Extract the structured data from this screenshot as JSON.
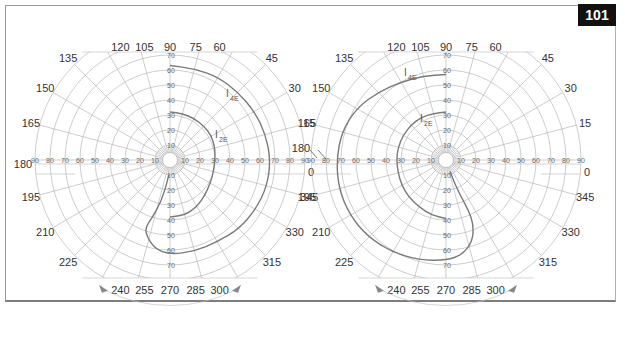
{
  "page": {
    "figure_number": "101",
    "frame_color": "#9a9a9a",
    "badge_bg": "#111111",
    "badge_fg": "#ffffff"
  },
  "chart_data": [
    {
      "type": "polar-visual-field",
      "title": "",
      "eye": "left-chart",
      "center": [
        170,
        160
      ],
      "px_per_degree": 1.5,
      "max_degree": 90,
      "clip_top_y": 52,
      "clip_bottom_y": 278,
      "meridian_labels": [
        "0",
        "15",
        "30",
        "45",
        "60",
        "75",
        "90",
        "105",
        "120",
        "135",
        "150",
        "165",
        "180",
        "195",
        "210",
        "225",
        "240",
        "255",
        "270",
        "285",
        "300",
        "315",
        "330",
        "345"
      ],
      "ring_labels_horizontal": [
        "10",
        "20",
        "30",
        "40",
        "50",
        "60",
        "70",
        "80",
        "90"
      ],
      "ring_labels_vertical": [
        "10",
        "20",
        "30",
        "40",
        "50",
        "60",
        "70"
      ],
      "isopters": [
        {
          "name": "I4E",
          "label": "I",
          "sub": "4E",
          "label_pos": [
            226,
            97
          ],
          "points": [
            [
              90,
              63
            ],
            [
              75,
              63
            ],
            [
              60,
              64
            ],
            [
              45,
              64
            ],
            [
              30,
              65
            ],
            [
              15,
              66
            ],
            [
              0,
              67
            ],
            [
              345,
              67
            ],
            [
              330,
              66
            ],
            [
              315,
              65
            ],
            [
              300,
              63
            ],
            [
              285,
              63
            ],
            [
              270,
              63
            ],
            [
              260,
              60
            ],
            [
              252,
              52
            ],
            [
              250,
              47
            ],
            [
              253,
              40
            ],
            [
              258,
              28
            ],
            [
              262,
              16
            ],
            [
              265,
              10
            ]
          ]
        },
        {
          "name": "I2E",
          "label": "I",
          "sub": "2E",
          "label_pos": [
            215,
            138
          ],
          "points": [
            [
              90,
              32
            ],
            [
              75,
              32
            ],
            [
              60,
              32
            ],
            [
              45,
              32
            ],
            [
              30,
              32
            ],
            [
              15,
              31
            ],
            [
              0,
              30
            ],
            [
              345,
              30
            ],
            [
              330,
              31
            ],
            [
              315,
              33
            ],
            [
              300,
              36
            ],
            [
              285,
              38
            ],
            [
              270,
              38
            ]
          ]
        }
      ],
      "bottom_arc": {
        "from_deg": 240,
        "to_deg": 300,
        "arrows": true
      }
    },
    {
      "type": "polar-visual-field",
      "title": "",
      "eye": "right-chart",
      "center": [
        446,
        160
      ],
      "px_per_degree": 1.5,
      "max_degree": 90,
      "clip_top_y": 52,
      "clip_bottom_y": 278,
      "meridian_labels": [
        "0",
        "15",
        "30",
        "45",
        "60",
        "75",
        "90",
        "105",
        "120",
        "135",
        "150",
        "165",
        "180",
        "195",
        "210",
        "225",
        "240",
        "255",
        "270",
        "285",
        "300",
        "315",
        "330",
        "345"
      ],
      "ring_labels_horizontal": [
        "10",
        "20",
        "30",
        "40",
        "50",
        "60",
        "70",
        "80",
        "90"
      ],
      "ring_labels_vertical": [
        "10",
        "20",
        "30",
        "40",
        "50",
        "60",
        "70"
      ],
      "isopters": [
        {
          "name": "I4E",
          "label": "I",
          "sub": "4E",
          "label_pos": [
            404,
            76
          ],
          "points": [
            [
              90,
              57
            ],
            [
              105,
              58
            ],
            [
              120,
              60
            ],
            [
              135,
              64
            ],
            [
              150,
              69
            ],
            [
              165,
              72
            ],
            [
              180,
              73
            ],
            [
              195,
              74
            ],
            [
              210,
              74
            ],
            [
              225,
              73
            ],
            [
              240,
              71
            ],
            [
              255,
              69
            ],
            [
              270,
              67
            ],
            [
              280,
              64
            ],
            [
              288,
              57
            ],
            [
              293,
              47
            ],
            [
              294,
              37
            ],
            [
              292,
              25
            ],
            [
              290,
              15
            ],
            [
              290,
              8
            ]
          ]
        },
        {
          "name": "I2E",
          "label": "I",
          "sub": "2E",
          "label_pos": [
            420,
            122
          ],
          "points": [
            [
              90,
              32
            ],
            [
              105,
              32
            ],
            [
              120,
              33
            ],
            [
              135,
              33
            ],
            [
              150,
              33
            ],
            [
              165,
              33
            ],
            [
              180,
              33
            ],
            [
              195,
              33
            ],
            [
              210,
              34
            ],
            [
              225,
              35
            ],
            [
              240,
              36
            ],
            [
              255,
              38
            ],
            [
              270,
              39
            ]
          ]
        }
      ],
      "bottom_arc": {
        "from_deg": 240,
        "to_deg": 300,
        "arrows": true
      }
    }
  ]
}
